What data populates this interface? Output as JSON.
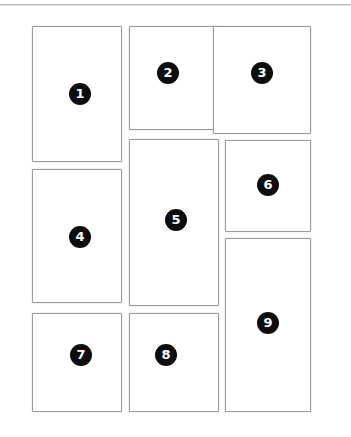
{
  "canvas": {
    "width": 351,
    "height": 437,
    "background": "#ffffff",
    "rule_color": "#b9b9b9"
  },
  "style": {
    "panel_border_color": "#9a9a9a",
    "panel_fill": "#ffffff",
    "badge_fill": "#0d0d0d",
    "badge_text_color": "#ffffff"
  },
  "panels": [
    {
      "label": "1",
      "name": "panel-1",
      "x": 32,
      "y": 26,
      "width": 90,
      "height": 136,
      "badge_x": 80,
      "badge_y": 94
    },
    {
      "label": "2",
      "name": "panel-2",
      "x": 129,
      "y": 26,
      "width": 90,
      "height": 104,
      "badge_x": 168,
      "badge_y": 73
    },
    {
      "label": "3",
      "name": "panel-3",
      "x": 213,
      "y": 26,
      "width": 98,
      "height": 108,
      "badge_x": 262,
      "badge_y": 73
    },
    {
      "label": "4",
      "name": "panel-4",
      "x": 32,
      "y": 169,
      "width": 90,
      "height": 134,
      "badge_x": 80,
      "badge_y": 237
    },
    {
      "label": "5",
      "name": "panel-5",
      "x": 129,
      "y": 139,
      "width": 90,
      "height": 167,
      "badge_x": 176,
      "badge_y": 220
    },
    {
      "label": "6",
      "name": "panel-6",
      "x": 225,
      "y": 140,
      "width": 86,
      "height": 92,
      "badge_x": 268,
      "badge_y": 185
    },
    {
      "label": "7",
      "name": "panel-7",
      "x": 32,
      "y": 313,
      "width": 90,
      "height": 99,
      "badge_x": 81,
      "badge_y": 355
    },
    {
      "label": "8",
      "name": "panel-8",
      "x": 129,
      "y": 313,
      "width": 90,
      "height": 99,
      "badge_x": 166,
      "badge_y": 355
    },
    {
      "label": "9",
      "name": "panel-9",
      "x": 225,
      "y": 238,
      "width": 86,
      "height": 174,
      "badge_x": 268,
      "badge_y": 323
    }
  ]
}
